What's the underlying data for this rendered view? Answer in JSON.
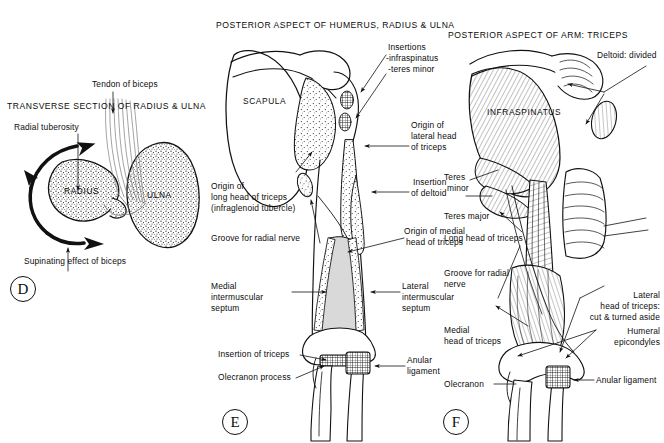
{
  "figure": {
    "kind": "anatomical-illustration",
    "background": "#ffffff",
    "ink": "#111111"
  },
  "panels": [
    {
      "id": "D",
      "badge": "D",
      "title": "TRANSVERSE SECTION OF RADIUS & ULNA",
      "bones": [
        "RADIUS",
        "ULNA"
      ],
      "labels": [
        "Tendon of biceps",
        "Radial tuberosity",
        "Supinating effect of biceps"
      ]
    },
    {
      "id": "E",
      "badge": "E",
      "title": "POSTERIOR ASPECT OF HUMERUS, RADIUS & ULNA",
      "bones": [
        "SCAPULA"
      ],
      "labels": [
        "Insertions",
        "-infraspinatus",
        "-teres minor",
        "Origin of\nlateral head\nof triceps",
        "Insertion\nof deltoid",
        "Origin of\nlong head of triceps\n(infraglenoid tubercle)",
        "Groove for radial nerve",
        "Origin of medial\nhead of triceps",
        "Medial\nintermuscular\nseptum",
        "Lateral\nintermuscular\nseptum",
        "Insertion of triceps",
        "Olecranon process",
        "Anular\nligament"
      ]
    },
    {
      "id": "F",
      "badge": "F",
      "title": "POSTERIOR ASPECT OF ARM: TRICEPS",
      "bones": [
        "INFRASPINATUS"
      ],
      "labels": [
        "Deltoid: divided",
        "Teres\nminor",
        "Teres major",
        "Long head of triceps",
        "Groove for radial\nnerve",
        "Medial\nhead of triceps",
        "Lateral\nhead of triceps:\ncut & turned aside",
        "Humeral\nepicondyles",
        "Olecranon",
        "Anular ligament"
      ]
    }
  ],
  "panelD": {
    "title": "TRANSVERSE SECTION OF RADIUS & ULNA",
    "badge": "D",
    "radius_label": "RADIUS",
    "ulna_label": "ULNA",
    "tendon_label": "Tendon of biceps",
    "tuberosity_label": "Radial tuberosity",
    "supinating_label": "Supinating effect of biceps"
  },
  "panelE": {
    "title": "POSTERIOR ASPECT OF HUMERUS, RADIUS & ULNA",
    "badge": "E",
    "scapula_label": "SCAPULA",
    "insertions_label": "Insertions",
    "infraspinatus_label": "-infraspinatus",
    "teres_minor_label": "-teres minor",
    "lateral_head_origin_l1": "Origin of",
    "lateral_head_origin_l2": "lateral head",
    "lateral_head_origin_l3": "of triceps",
    "deltoid_insertion_l1": "Insertion",
    "deltoid_insertion_l2": "of deltoid",
    "long_head_origin_l1": "Origin of",
    "long_head_origin_l2": "long head of triceps",
    "long_head_origin_l3": "(infraglenoid tubercle)",
    "radial_groove_label": "Groove for radial nerve",
    "medial_head_origin_l1": "Origin of medial",
    "medial_head_origin_l2": "head of triceps",
    "medial_septum_l1": "Medial",
    "medial_septum_l2": "intermuscular",
    "medial_septum_l3": "septum",
    "lateral_septum_l1": "Lateral",
    "lateral_septum_l2": "intermuscular",
    "lateral_septum_l3": "septum",
    "triceps_insertion_label": "Insertion of triceps",
    "olecranon_label": "Olecranon process",
    "anular_l1": "Anular",
    "anular_l2": "ligament"
  },
  "panelF": {
    "title": "POSTERIOR ASPECT OF ARM: TRICEPS",
    "badge": "F",
    "infraspinatus_label": "INFRASPINATUS",
    "deltoid_label": "Deltoid: divided",
    "teres_minor_l1": "Teres",
    "teres_minor_l2": "minor",
    "teres_major_label": "Teres major",
    "long_head_label": "Long head of triceps",
    "radial_groove_l1": "Groove for radial",
    "radial_groove_l2": "nerve",
    "medial_head_l1": "Medial",
    "medial_head_l2": "head of triceps",
    "lateral_head_l1": "Lateral",
    "lateral_head_l2": "head of triceps:",
    "lateral_head_l3": "cut & turned aside",
    "epicondyles_l1": "Humeral",
    "epicondyles_l2": "epicondyles",
    "olecranon_label": "Olecranon",
    "anular_label": "Anular ligament"
  }
}
